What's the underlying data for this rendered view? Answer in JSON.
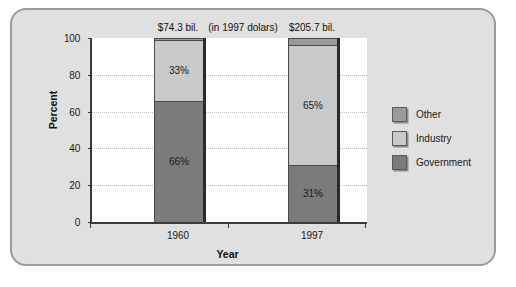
{
  "chart_data": {
    "type": "bar",
    "subtype": "stacked-bar-100-percent",
    "title": "",
    "xlabel": "Year",
    "ylabel": "Percent",
    "ylim": [
      0,
      100
    ],
    "yticks": [
      0,
      20,
      40,
      60,
      80,
      100
    ],
    "grid": true,
    "legend_position": "right",
    "note": "(in 1997 dolars)",
    "categories": [
      "1960",
      "1997"
    ],
    "category_totals": [
      "$74.3 bil.",
      "$205.7 bil."
    ],
    "series": [
      {
        "name": "Government",
        "color": "#7b7b7b",
        "values": [
          66,
          31
        ],
        "labels": [
          "66%",
          "31%"
        ]
      },
      {
        "name": "Industry",
        "color": "#c9c9c9",
        "values": [
          33,
          65
        ],
        "labels": [
          "33%",
          "65%"
        ]
      },
      {
        "name": "Other",
        "color": "#9a9a9a",
        "values": [
          1,
          4
        ],
        "labels": [
          "",
          ""
        ]
      }
    ]
  },
  "axes": {
    "y_title": "Percent",
    "x_title": "Year",
    "y_tick_labels": [
      "100",
      "80",
      "60",
      "40",
      "20",
      "0"
    ],
    "x_tick_labels": [
      "1960",
      "1997"
    ]
  },
  "annotations": {
    "bar1_value": "$74.3 bil.",
    "bar2_value": "$205.7 bil.",
    "center_note": "(in 1997 dolars)"
  },
  "bars": [
    {
      "category": "1960",
      "top_label": "$74.3 bil.",
      "segments": [
        {
          "name": "Other",
          "percent": 1,
          "label": "",
          "color": "#9a9a9a"
        },
        {
          "name": "Industry",
          "percent": 33,
          "label": "33%",
          "color": "#c9c9c9"
        },
        {
          "name": "Government",
          "percent": 66,
          "label": "66%",
          "color": "#7b7b7b"
        }
      ]
    },
    {
      "category": "1997",
      "top_label": "$205.7 bil.",
      "segments": [
        {
          "name": "Other",
          "percent": 4,
          "label": "",
          "color": "#9a9a9a"
        },
        {
          "name": "Industry",
          "percent": 65,
          "label": "65%",
          "color": "#c9c9c9"
        },
        {
          "name": "Government",
          "percent": 31,
          "label": "31%",
          "color": "#7b7b7b"
        }
      ]
    }
  ],
  "legend": {
    "items": [
      {
        "label": "Other",
        "color": "#9a9a9a"
      },
      {
        "label": "Industry",
        "color": "#c9c9c9"
      },
      {
        "label": "Government",
        "color": "#7b7b7b"
      }
    ]
  },
  "colors": {
    "figure_background": "#e0e0e0",
    "plot_background": "#ffffff",
    "frame_border": "#9b9b9b",
    "axis": "#3a3a3a",
    "gridline": "#b9b9b9",
    "government": "#7b7b7b",
    "industry": "#c9c9c9",
    "other": "#9a9a9a"
  }
}
